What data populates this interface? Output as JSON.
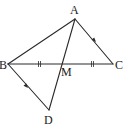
{
  "diagram": {
    "type": "geometry-figure",
    "points": {
      "A": {
        "label": "A",
        "x": 75,
        "y": 19
      },
      "B": {
        "label": "B",
        "x": 8,
        "y": 64
      },
      "C": {
        "label": "C",
        "x": 113,
        "y": 64
      },
      "M": {
        "label": "M",
        "x": 61,
        "y": 64
      },
      "D": {
        "label": "D",
        "x": 49,
        "y": 110
      }
    },
    "segments": [
      "AB",
      "AC",
      "BC",
      "AD",
      "BD"
    ],
    "equal_marks": [
      "BM",
      "MC"
    ],
    "parallel_marks": [
      "AC",
      "BD"
    ],
    "colors": {
      "stroke": "#2a2a2a",
      "background": "#ffffff"
    }
  }
}
